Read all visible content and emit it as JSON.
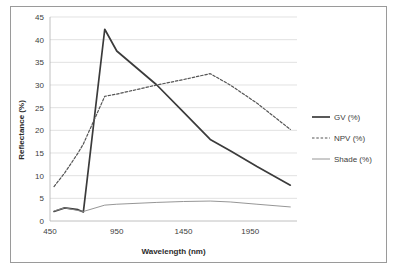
{
  "figure": {
    "frame_color": "#9a9a9a",
    "background": "#ffffff"
  },
  "chart_data": {
    "type": "line",
    "title": "",
    "xlabel": "Wavelength (nm)",
    "ylabel": "Reflectance (%)",
    "xlim": [
      450,
      2300
    ],
    "ylim": [
      0,
      45
    ],
    "ytick_step": 5,
    "xticks": [
      450,
      950,
      1450,
      1950
    ],
    "yticks": [
      0,
      5,
      10,
      15,
      20,
      25,
      30,
      35,
      40,
      45
    ],
    "grid": "horizontal",
    "legend_position": "right",
    "x": [
      480,
      560,
      660,
      700,
      860,
      950,
      1250,
      1450,
      1650,
      1800,
      2000,
      2250
    ],
    "series": [
      {
        "name": "GV  (%)",
        "style": "solid",
        "color": "#3b3b3b",
        "width": 1.7,
        "values": [
          2.1,
          2.9,
          2.5,
          2.0,
          42.3,
          37.5,
          30.0,
          24.0,
          18.0,
          15.5,
          12.0,
          7.9
        ]
      },
      {
        "name": "NPV (%)",
        "style": "dashed",
        "color": "#555555",
        "width": 1.2,
        "values": [
          7.6,
          10.6,
          15.0,
          17.0,
          27.5,
          28.0,
          30.0,
          31.2,
          32.5,
          30.0,
          26.0,
          20.2
        ]
      },
      {
        "name": "Shade (%)",
        "style": "solid",
        "color": "#8a8a8a",
        "width": 0.9,
        "values": [
          2.2,
          2.9,
          2.3,
          2.1,
          3.5,
          3.7,
          4.1,
          4.3,
          4.4,
          4.2,
          3.7,
          3.1
        ]
      }
    ]
  },
  "legend": {
    "items": [
      {
        "label": "GV  (%)",
        "style": "solid",
        "color": "#3b3b3b",
        "width": 1.7
      },
      {
        "label": "NPV (%)",
        "style": "dashed",
        "color": "#555555",
        "width": 1.2
      },
      {
        "label": "Shade (%)",
        "style": "solid",
        "color": "#8a8a8a",
        "width": 0.9
      }
    ]
  },
  "axes": {
    "x_tick_labels": [
      "450",
      "950",
      "1450",
      "1950"
    ],
    "y_tick_labels": [
      "0",
      "5",
      "10",
      "15",
      "20",
      "25",
      "30",
      "35",
      "40",
      "45"
    ],
    "x_axis_title": "Wavelength (nm)",
    "y_axis_title": "Reflectance (%)"
  }
}
